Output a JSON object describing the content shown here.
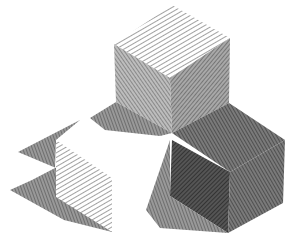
{
  "image": {
    "subject": "Crosshatched pen drawing of geometric solids with cast shadows",
    "background": "#ffffff",
    "ink_color": "#222222",
    "objects": [
      {
        "name": "top-cube",
        "faces": [
          "top-light",
          "left-mid",
          "right-mid"
        ]
      },
      {
        "name": "bottom-right-cube",
        "faces": [
          "top-dark",
          "left-darkest",
          "right-dark"
        ]
      },
      {
        "name": "left-step-shape",
        "faces": [
          "front-light",
          "shadow-dark"
        ]
      }
    ]
  }
}
